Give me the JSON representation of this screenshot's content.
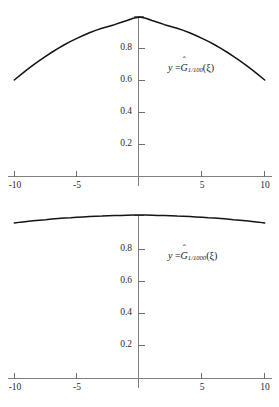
{
  "figure": {
    "background_color": "#ffffff",
    "curve_color": "#141414",
    "axis_color": "#808080",
    "text_color": "#1a1a1a"
  },
  "panels": [
    {
      "id": "top",
      "label": {
        "lhs": "y",
        "equals": "=",
        "func_base": "G",
        "hat": "ˆ",
        "subscript": "1/100",
        "argument": "(ξ)",
        "full_text": "y = Ĝ_{1/100}(ξ)"
      },
      "xticks": [
        "-10",
        "-5",
        "",
        "5",
        "10"
      ],
      "yticks": [
        "",
        "0.2",
        "0.4",
        "0.6",
        "0.8",
        ""
      ]
    },
    {
      "id": "bottom",
      "label": {
        "lhs": "y",
        "equals": "=",
        "func_base": "G",
        "hat": "ˆ",
        "subscript": "1/1000",
        "argument": "(ξ)",
        "full_text": "y = Ĝ_{1/1000}(ξ)"
      },
      "xticks": [
        "-10",
        "-5",
        "",
        "5",
        "10"
      ],
      "yticks": [
        "",
        "0.2",
        "0.4",
        "0.6",
        "0.8",
        ""
      ]
    }
  ],
  "chart_data": [
    {
      "type": "line",
      "title": "",
      "subtitle": "",
      "xlabel": "",
      "ylabel": "",
      "xlim": [
        -10,
        10
      ],
      "ylim": [
        0,
        1.04
      ],
      "grid": false,
      "legend": "inline-annotation",
      "annotation": "y = Ĝ_{1/100}(ξ)",
      "xticks": [
        -10,
        -5,
        0,
        5,
        10
      ],
      "xticklabels": [
        "-10",
        "-5",
        "",
        "5",
        "10"
      ],
      "yticks": [
        0.2,
        0.4,
        0.6,
        0.8,
        1.0
      ],
      "yticklabels": [
        "0.2",
        "0.4",
        "0.6",
        "0.8",
        ""
      ],
      "series": [
        {
          "name": "G_hat_1/100",
          "x": [
            -10,
            -9.5,
            -9,
            -8.5,
            -8,
            -7.5,
            -7,
            -6.5,
            -6,
            -5.5,
            -5,
            -4.5,
            -4,
            -3.5,
            -3,
            -2.5,
            -2,
            -1.5,
            -1,
            -0.5,
            0,
            0.5,
            1,
            1.5,
            2,
            2.5,
            3,
            3.5,
            4,
            4.5,
            5,
            5.5,
            6,
            6.5,
            7,
            7.5,
            8,
            8.5,
            9,
            9.5,
            10
          ],
          "values": [
            0.605,
            0.637,
            0.668,
            0.698,
            0.726,
            0.753,
            0.779,
            0.803,
            0.826,
            0.847,
            0.866,
            0.884,
            0.901,
            0.916,
            0.929,
            0.941,
            0.952,
            0.965,
            0.978,
            0.992,
            1.0,
            0.992,
            0.978,
            0.965,
            0.952,
            0.941,
            0.929,
            0.916,
            0.901,
            0.884,
            0.866,
            0.847,
            0.826,
            0.803,
            0.779,
            0.753,
            0.726,
            0.698,
            0.668,
            0.637,
            0.605
          ]
        }
      ]
    },
    {
      "type": "line",
      "title": "",
      "subtitle": "",
      "xlabel": "",
      "ylabel": "",
      "xlim": [
        -10,
        10
      ],
      "ylim": [
        0,
        1.04
      ],
      "grid": false,
      "legend": "inline-annotation",
      "annotation": "y = Ĝ_{1/1000}(ξ)",
      "xticks": [
        -10,
        -5,
        0,
        5,
        10
      ],
      "xticklabels": [
        "-10",
        "-5",
        "",
        "5",
        "10"
      ],
      "yticks": [
        0.2,
        0.4,
        0.6,
        0.8,
        1.0
      ],
      "yticklabels": [
        "0.2",
        "0.4",
        "0.6",
        "0.8",
        ""
      ],
      "series": [
        {
          "name": "G_hat_1/1000",
          "x": [
            -10,
            -9.5,
            -9,
            -8.5,
            -8,
            -7.5,
            -7,
            -6.5,
            -6,
            -5.5,
            -5,
            -4.5,
            -4,
            -3.5,
            -3,
            -2.5,
            -2,
            -1.5,
            -1,
            -0.5,
            0,
            0.5,
            1,
            1.5,
            2,
            2.5,
            3,
            3.5,
            4,
            4.5,
            5,
            5.5,
            6,
            6.5,
            7,
            7.5,
            8,
            8.5,
            9,
            9.5,
            10
          ],
          "values": [
            0.952,
            0.957,
            0.961,
            0.965,
            0.969,
            0.972,
            0.976,
            0.979,
            0.982,
            0.984,
            0.987,
            0.989,
            0.991,
            0.993,
            0.994,
            0.996,
            0.997,
            0.998,
            0.999,
            1.0,
            1.0,
            1.0,
            0.999,
            0.998,
            0.997,
            0.996,
            0.994,
            0.993,
            0.991,
            0.989,
            0.987,
            0.984,
            0.982,
            0.979,
            0.976,
            0.972,
            0.969,
            0.965,
            0.961,
            0.957,
            0.952
          ]
        }
      ]
    }
  ]
}
